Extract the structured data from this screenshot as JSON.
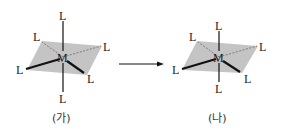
{
  "diagram": {
    "left": {
      "center_atom": "M",
      "ligand": "L",
      "caption": "(가)",
      "geometry": "octahedral"
    },
    "right": {
      "center_atom": "M",
      "ligand": "L",
      "caption": "(나)",
      "geometry": "distorted octahedral (shortened axial)"
    },
    "arrow": "→",
    "colors": {
      "plane": "#c4c4c4",
      "bond": "#111111"
    }
  }
}
